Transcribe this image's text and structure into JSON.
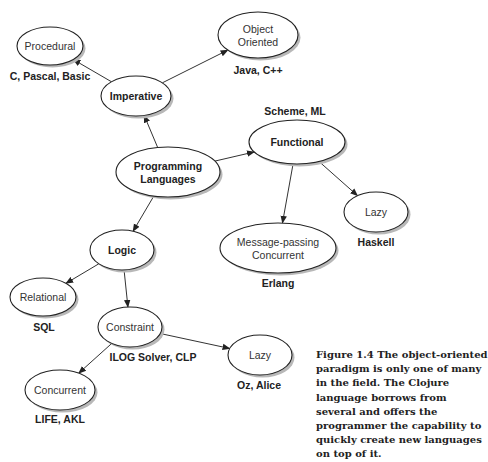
{
  "nodes": [
    {
      "id": "procedural",
      "label": [
        "Procedural"
      ],
      "bold": false,
      "example": "C, Pascal, Basic"
    },
    {
      "id": "object-oriented",
      "label": [
        "Object",
        "Oriented"
      ],
      "bold": false,
      "example": "Java, C++"
    },
    {
      "id": "imperative",
      "label": [
        "Imperative"
      ],
      "bold": true,
      "example": ""
    },
    {
      "id": "programming-languages",
      "label": [
        "Programming",
        "Languages"
      ],
      "bold": true,
      "example": ""
    },
    {
      "id": "functional",
      "label": [
        "Functional"
      ],
      "bold": true,
      "example": "Scheme, ML"
    },
    {
      "id": "lazy-functional",
      "label": [
        "Lazy"
      ],
      "bold": false,
      "example": "Haskell"
    },
    {
      "id": "message-passing-concurrent",
      "label": [
        "Message-passing",
        "Concurrent"
      ],
      "bold": false,
      "example": "Erlang"
    },
    {
      "id": "logic",
      "label": [
        "Logic"
      ],
      "bold": true,
      "example": ""
    },
    {
      "id": "relational",
      "label": [
        "Relational"
      ],
      "bold": false,
      "example": "SQL"
    },
    {
      "id": "constraint",
      "label": [
        "Constraint"
      ],
      "bold": false,
      "example": "ILOG Solver, CLP"
    },
    {
      "id": "lazy-logic",
      "label": [
        "Lazy"
      ],
      "bold": false,
      "example": "Oz, Alice"
    },
    {
      "id": "concurrent",
      "label": [
        "Concurrent"
      ],
      "bold": false,
      "example": "LIFE, AKL"
    }
  ],
  "edges": [
    {
      "from": "programming-languages",
      "to": "imperative"
    },
    {
      "from": "programming-languages",
      "to": "functional"
    },
    {
      "from": "programming-languages",
      "to": "logic"
    },
    {
      "from": "imperative",
      "to": "procedural"
    },
    {
      "from": "imperative",
      "to": "object-oriented"
    },
    {
      "from": "functional",
      "to": "message-passing-concurrent"
    },
    {
      "from": "functional",
      "to": "lazy-functional"
    },
    {
      "from": "logic",
      "to": "relational"
    },
    {
      "from": "logic",
      "to": "constraint"
    },
    {
      "from": "constraint",
      "to": "concurrent"
    },
    {
      "from": "constraint",
      "to": "lazy-logic"
    }
  ],
  "caption": "Figure 1.4   The object-oriented paradigm is only one of many in the field. The Clojure language borrows from several and offers the programmer the capability to quickly create new languages on top of it."
}
